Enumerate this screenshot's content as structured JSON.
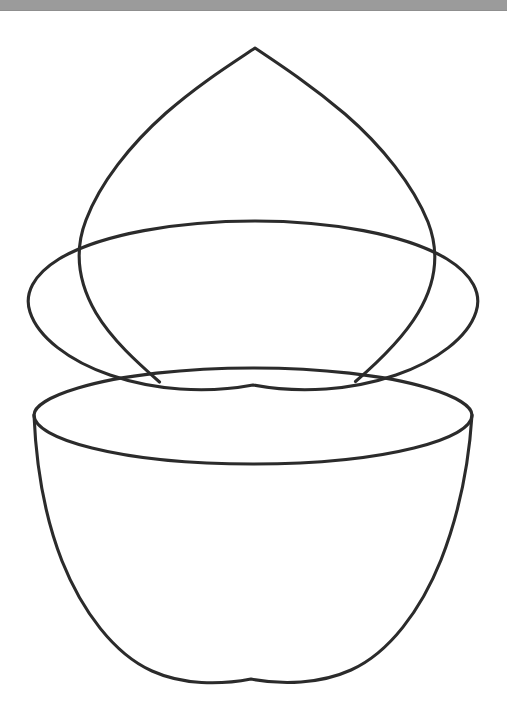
{
  "window": {
    "titlebar_color": "#9b9b9b",
    "background_color": "#ffffff"
  },
  "figure": {
    "name": "split-egg-line-drawing",
    "stroke_color": "#2b2b2b",
    "stroke_width": 3.1,
    "fill": "none",
    "description": "Black outline line drawing of an egg-shaped solid split into an upper dome and a lower bowl, each showing an elliptical cut face, separated by a gap",
    "parts": [
      {
        "name": "upper-dome-outline",
        "label": "Upper dome outline",
        "apex": [
          255,
          37
        ],
        "left_cusp": [
          160,
          371
        ],
        "right_cusp": [
          355,
          370
        ]
      },
      {
        "name": "upper-ellipse-cut-face",
        "label": "Upper cut-face ellipse",
        "center": [
          253,
          292
        ],
        "rx": 228,
        "ry": 82
      },
      {
        "name": "lower-ellipse-cut-face",
        "label": "Lower cut-face ellipse",
        "center": [
          253,
          404
        ],
        "rx": 219,
        "ry": 47
      },
      {
        "name": "lower-bowl-outline",
        "label": "Lower bowl outline",
        "bottom": [
          251,
          668
        ],
        "left_rim": [
          34,
          397
        ],
        "right_rim": [
          472,
          397
        ]
      }
    ]
  }
}
